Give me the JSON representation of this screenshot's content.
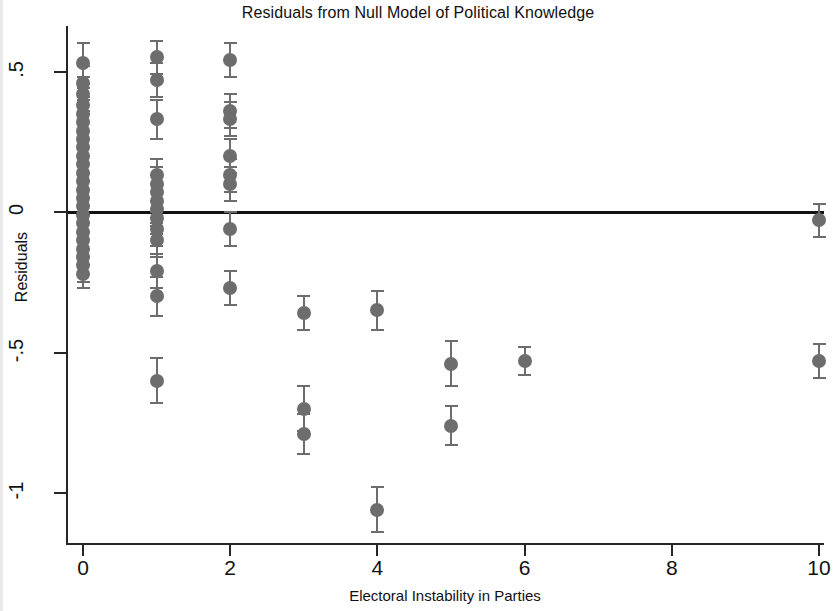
{
  "chart_data": {
    "type": "scatter",
    "title": "Residuals from Null Model of Political Knowledge",
    "xlabel": "Electoral Instability in Parties",
    "ylabel": "Residuals",
    "xlim": [
      -0.35,
      10.6
    ],
    "ylim": [
      -1.22,
      0.66
    ],
    "xticks": [
      0,
      2,
      4,
      6,
      8,
      10
    ],
    "xtick_labels": [
      "0",
      "2",
      "4",
      "6",
      "8",
      "10"
    ],
    "yticks": [
      0.5,
      0,
      -0.5,
      -1
    ],
    "ytick_labels": [
      ".5",
      "0",
      "-.5",
      "-1"
    ],
    "grid": false,
    "legend": null,
    "reference_lines": [
      {
        "axis": "y",
        "value": 0,
        "style": "solid",
        "color": "#111111"
      }
    ],
    "marker_color": "#6d6d6d",
    "errorbar_color": "#6d6d6d",
    "series": [
      {
        "name": "Residuals with 95% CI",
        "points": [
          {
            "x": 0,
            "y": 0.53,
            "lo": 0.46,
            "hi": 0.6
          },
          {
            "x": 0,
            "y": 0.46,
            "lo": 0.4,
            "hi": 0.52
          },
          {
            "x": 0,
            "y": 0.42,
            "lo": 0.36,
            "hi": 0.48
          },
          {
            "x": 0,
            "y": 0.38,
            "lo": 0.32,
            "hi": 0.44
          },
          {
            "x": 0,
            "y": 0.35,
            "lo": 0.29,
            "hi": 0.41
          },
          {
            "x": 0,
            "y": 0.32,
            "lo": 0.26,
            "hi": 0.38
          },
          {
            "x": 0,
            "y": 0.29,
            "lo": 0.23,
            "hi": 0.35
          },
          {
            "x": 0,
            "y": 0.26,
            "lo": 0.2,
            "hi": 0.32
          },
          {
            "x": 0,
            "y": 0.23,
            "lo": 0.17,
            "hi": 0.29
          },
          {
            "x": 0,
            "y": 0.2,
            "lo": 0.14,
            "hi": 0.26
          },
          {
            "x": 0,
            "y": 0.17,
            "lo": 0.11,
            "hi": 0.23
          },
          {
            "x": 0,
            "y": 0.14,
            "lo": 0.08,
            "hi": 0.2
          },
          {
            "x": 0,
            "y": 0.11,
            "lo": 0.05,
            "hi": 0.17
          },
          {
            "x": 0,
            "y": 0.08,
            "lo": 0.02,
            "hi": 0.14
          },
          {
            "x": 0,
            "y": 0.05,
            "lo": -0.01,
            "hi": 0.11
          },
          {
            "x": 0,
            "y": 0.02,
            "lo": -0.04,
            "hi": 0.08
          },
          {
            "x": 0,
            "y": -0.01,
            "lo": -0.07,
            "hi": 0.05
          },
          {
            "x": 0,
            "y": -0.04,
            "lo": -0.1,
            "hi": 0.02
          },
          {
            "x": 0,
            "y": -0.07,
            "lo": -0.13,
            "hi": -0.01
          },
          {
            "x": 0,
            "y": -0.1,
            "lo": -0.16,
            "hi": -0.04
          },
          {
            "x": 0,
            "y": -0.13,
            "lo": -0.19,
            "hi": -0.07
          },
          {
            "x": 0,
            "y": -0.16,
            "lo": -0.22,
            "hi": -0.1
          },
          {
            "x": 0,
            "y": -0.19,
            "lo": -0.25,
            "hi": -0.13
          },
          {
            "x": 0,
            "y": -0.22,
            "lo": -0.27,
            "hi": -0.16
          },
          {
            "x": 1,
            "y": 0.55,
            "lo": 0.49,
            "hi": 0.61
          },
          {
            "x": 1,
            "y": 0.47,
            "lo": 0.41,
            "hi": 0.53
          },
          {
            "x": 1,
            "y": 0.33,
            "lo": 0.26,
            "hi": 0.4
          },
          {
            "x": 1,
            "y": 0.13,
            "lo": 0.07,
            "hi": 0.19
          },
          {
            "x": 1,
            "y": 0.1,
            "lo": 0.04,
            "hi": 0.16
          },
          {
            "x": 1,
            "y": 0.07,
            "lo": 0.01,
            "hi": 0.13
          },
          {
            "x": 1,
            "y": 0.04,
            "lo": -0.02,
            "hi": 0.1
          },
          {
            "x": 1,
            "y": 0.01,
            "lo": -0.05,
            "hi": 0.07
          },
          {
            "x": 1,
            "y": -0.02,
            "lo": -0.08,
            "hi": 0.04
          },
          {
            "x": 1,
            "y": -0.06,
            "lo": -0.12,
            "hi": 0.0
          },
          {
            "x": 1,
            "y": -0.1,
            "lo": -0.16,
            "hi": -0.04
          },
          {
            "x": 1,
            "y": -0.21,
            "lo": -0.27,
            "hi": -0.15
          },
          {
            "x": 1,
            "y": -0.3,
            "lo": -0.37,
            "hi": -0.23
          },
          {
            "x": 1,
            "y": -0.6,
            "lo": -0.68,
            "hi": -0.52
          },
          {
            "x": 2,
            "y": 0.54,
            "lo": 0.48,
            "hi": 0.6
          },
          {
            "x": 2,
            "y": 0.36,
            "lo": 0.3,
            "hi": 0.42
          },
          {
            "x": 2,
            "y": 0.33,
            "lo": 0.27,
            "hi": 0.39
          },
          {
            "x": 2,
            "y": 0.2,
            "lo": 0.14,
            "hi": 0.26
          },
          {
            "x": 2,
            "y": 0.13,
            "lo": 0.07,
            "hi": 0.19
          },
          {
            "x": 2,
            "y": 0.1,
            "lo": 0.04,
            "hi": 0.16
          },
          {
            "x": 2,
            "y": -0.06,
            "lo": -0.12,
            "hi": 0.0
          },
          {
            "x": 2,
            "y": -0.27,
            "lo": -0.33,
            "hi": -0.21
          },
          {
            "x": 3,
            "y": -0.36,
            "lo": -0.42,
            "hi": -0.3
          },
          {
            "x": 3,
            "y": -0.7,
            "lo": -0.78,
            "hi": -0.62
          },
          {
            "x": 3,
            "y": -0.79,
            "lo": -0.86,
            "hi": -0.72
          },
          {
            "x": 4,
            "y": -0.35,
            "lo": -0.42,
            "hi": -0.28
          },
          {
            "x": 4,
            "y": -1.06,
            "lo": -1.14,
            "hi": -0.98
          },
          {
            "x": 5,
            "y": -0.54,
            "lo": -0.62,
            "hi": -0.46
          },
          {
            "x": 5,
            "y": -0.76,
            "lo": -0.83,
            "hi": -0.69
          },
          {
            "x": 6,
            "y": -0.53,
            "lo": -0.58,
            "hi": -0.48
          },
          {
            "x": 10,
            "y": -0.03,
            "lo": -0.09,
            "hi": 0.03
          },
          {
            "x": 10,
            "y": -0.53,
            "lo": -0.59,
            "hi": -0.47
          }
        ]
      }
    ]
  }
}
